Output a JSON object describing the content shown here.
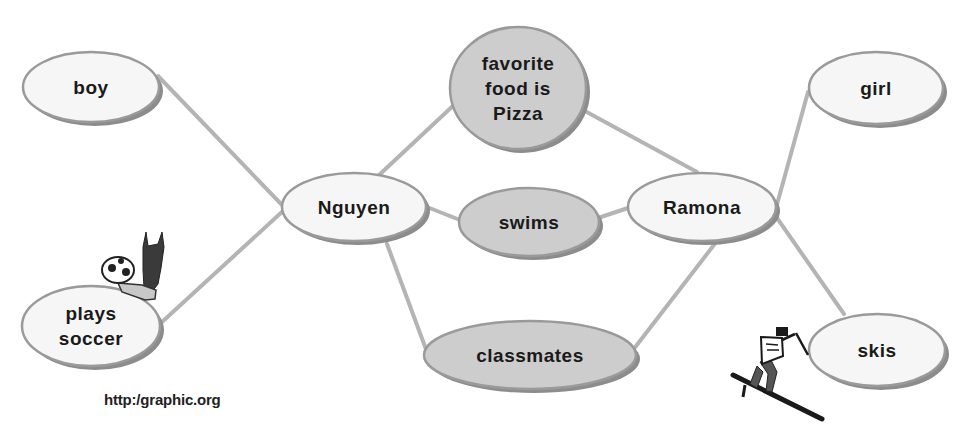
{
  "diagram": {
    "type": "double-bubble-map",
    "colors": {
      "background": "#ffffff",
      "connector": "#b4b4b4",
      "ellipse_outline": "#9a9a9a",
      "ellipse_shadow": "#8c8c8c",
      "light_fill": "#f6f6f6",
      "shared_fill": "#cdcdcd",
      "text": "#1a1a1a"
    },
    "nodes": {
      "boy": {
        "label": "boy",
        "kind": "unique-left"
      },
      "plays_soccer": {
        "label": "plays\nsoccer",
        "kind": "unique-left"
      },
      "nguyen": {
        "label": "Nguyen",
        "kind": "subject"
      },
      "favorite_food": {
        "label": "favorite\nfood is\nPizza",
        "kind": "shared"
      },
      "swims": {
        "label": "swims",
        "kind": "shared"
      },
      "classmates": {
        "label": "classmates",
        "kind": "shared"
      },
      "ramona": {
        "label": "Ramona",
        "kind": "subject"
      },
      "girl": {
        "label": "girl",
        "kind": "unique-right"
      },
      "skis": {
        "label": "skis",
        "kind": "unique-right"
      }
    },
    "edges": [
      {
        "from": "boy",
        "to": "nguyen"
      },
      {
        "from": "plays_soccer",
        "to": "nguyen"
      },
      {
        "from": "nguyen",
        "to": "favorite_food"
      },
      {
        "from": "nguyen",
        "to": "swims"
      },
      {
        "from": "nguyen",
        "to": "classmates"
      },
      {
        "from": "favorite_food",
        "to": "ramona"
      },
      {
        "from": "swims",
        "to": "ramona"
      },
      {
        "from": "classmates",
        "to": "ramona"
      },
      {
        "from": "ramona",
        "to": "girl"
      },
      {
        "from": "ramona",
        "to": "skis"
      }
    ],
    "clipart": [
      {
        "name": "soccer-ball-kick",
        "near": "plays_soccer"
      },
      {
        "name": "skier",
        "near": "skis"
      }
    ],
    "credit": "http:/graphic.org"
  }
}
